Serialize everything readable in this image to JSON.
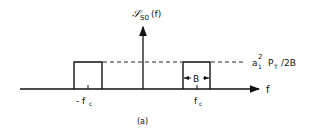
{
  "figure": {
    "caption": "(a)",
    "colors": {
      "ink": "#111111",
      "background": "#ffffff"
    }
  },
  "axes": {
    "y_label_main": "𝒮",
    "y_label_sub": "S0",
    "y_label_arg": "(f)",
    "x_label": "f"
  },
  "spectrum": {
    "bands": [
      {
        "center_label": "- f",
        "center_sub": "c"
      },
      {
        "center_label": "f",
        "center_sub": "c",
        "width_label": "B"
      }
    ],
    "level_label_a": "a",
    "level_label_a_sub": "1",
    "level_label_a_sup": "2",
    "level_label_p": "P",
    "level_label_p_sub": "T",
    "level_label_tail": "/2B"
  }
}
